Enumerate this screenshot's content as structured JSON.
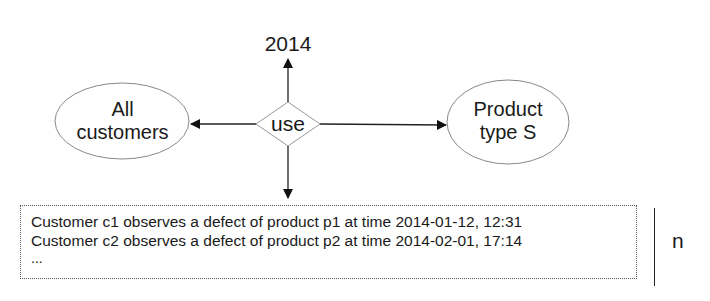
{
  "diagram": {
    "relationship": {
      "label": "use"
    },
    "time_node": {
      "label": "2014"
    },
    "entities": [
      {
        "id": "customers",
        "line1": "All",
        "line2": "customers"
      },
      {
        "id": "product",
        "line1": "Product",
        "line2": "type S"
      }
    ],
    "records": {
      "lines": [
        "Customer c1 observes a defect of product p1 at time 2014-01-12, 12:31",
        "Customer c2 observes a defect of product p2 at time 2014-02-01, 17:14",
        "..."
      ],
      "multiplicity": "n"
    },
    "colors": {
      "stroke": "#222222",
      "shape_outline": "#888888",
      "text": "#1a1a1a",
      "background": "#ffffff"
    }
  }
}
